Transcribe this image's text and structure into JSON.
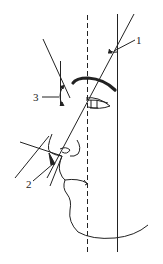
{
  "diagram": {
    "type": "facial-profile-angle-diagram",
    "labels": {
      "angle1": "1",
      "angle2": "2",
      "angle3": "3"
    },
    "colors": {
      "stroke": "#222222",
      "background": "#ffffff"
    },
    "elements": [
      {
        "name": "vertical-dashed-reference-line",
        "style": "dashed"
      },
      {
        "name": "vertical-solid-reference-line",
        "style": "solid"
      },
      {
        "name": "facial-profile-line",
        "style": "solid"
      },
      {
        "name": "forehead-tangent-line",
        "style": "solid"
      },
      {
        "name": "eyebrow",
        "style": "thick"
      },
      {
        "name": "eye",
        "style": "outline"
      },
      {
        "name": "nose-outline",
        "style": "solid"
      },
      {
        "name": "lip-lines",
        "style": "solid"
      },
      {
        "name": "chin-jaw-curve",
        "style": "solid"
      }
    ]
  }
}
